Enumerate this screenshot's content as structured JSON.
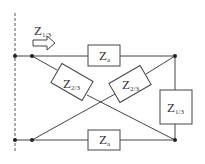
{
  "diagram": {
    "type": "lattice-network-circuit",
    "colors": {
      "line": "#444444",
      "background": "#ffffff",
      "text": "#333333"
    },
    "input_label": {
      "main": "Z",
      "sub": "1/3"
    },
    "arrow": {
      "direction": "right"
    },
    "components": {
      "top_series": {
        "main": "Z",
        "sub": "a"
      },
      "bottom_series": {
        "main": "Z",
        "sub": "a"
      },
      "diag_left": {
        "main": "Z",
        "sub": "2/3"
      },
      "diag_right": {
        "main": "Z",
        "sub": "2/3"
      },
      "shunt_right": {
        "main": "Z",
        "sub": "1/3"
      }
    }
  }
}
